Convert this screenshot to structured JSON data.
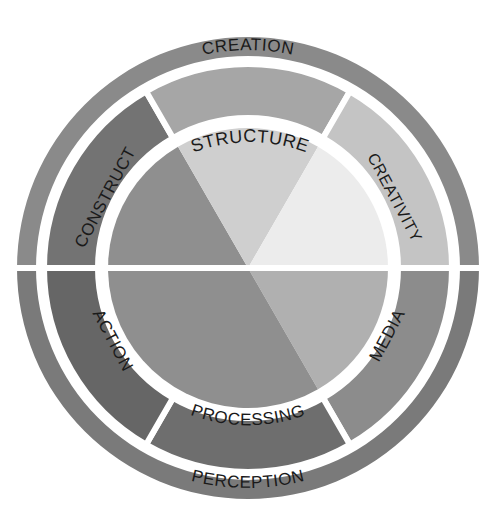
{
  "diagram": {
    "center": [
      248,
      268
    ],
    "outer_ring": {
      "r_outer": 231,
      "r_inner": 212,
      "segments": [
        {
          "id": "creation",
          "label": "CREATION",
          "start": 180,
          "end": 360,
          "color": "#8a8a8a"
        },
        {
          "id": "perception",
          "label": "PERCEPTION",
          "start": 0,
          "end": 180,
          "color": "#7a7a7a"
        }
      ]
    },
    "middle_ring": {
      "r_outer": 204,
      "r_inner": 150,
      "segments": [
        {
          "id": "media",
          "label": "MEDIA",
          "start": 0,
          "end": 60,
          "color": "#8c8c8c"
        },
        {
          "id": "processing",
          "label": "PROCESSING",
          "start": 60,
          "end": 120,
          "color": "#6e6e6e"
        },
        {
          "id": "action",
          "label": "ACTION",
          "start": 120,
          "end": 180,
          "color": "#666666"
        },
        {
          "id": "construct",
          "label": "CONSTRUCT",
          "start": 180,
          "end": 240,
          "color": "#737373"
        },
        {
          "id": "structure",
          "label": "STRUCTURE",
          "start": 240,
          "end": 300,
          "color": "#a6a6a6"
        },
        {
          "id": "creativity",
          "label": "CREATIVITY",
          "start": 300,
          "end": 360,
          "color": "#c4c4c4"
        }
      ]
    },
    "inner_pie": {
      "r": 140,
      "slices": [
        {
          "id": "pie-media",
          "start": 0,
          "end": 60,
          "color": "#b0b0b0"
        },
        {
          "id": "pie-dark",
          "start": 60,
          "end": 240,
          "color": "#8f8f8f"
        },
        {
          "id": "pie-structure",
          "start": 240,
          "end": 300,
          "color": "#cfcfcf"
        },
        {
          "id": "pie-creativity",
          "start": 300,
          "end": 360,
          "color": "#ececec"
        }
      ]
    }
  }
}
